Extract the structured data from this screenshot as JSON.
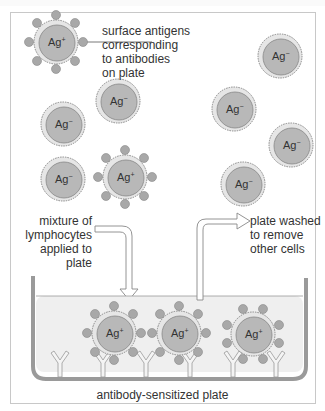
{
  "diagram": {
    "labels": {
      "surface_antigens": "surface antigens\ncorresponding\nto antibodies\non plate",
      "mixture": "mixture of\nlymphocytes\napplied to plate",
      "washed": "plate washed\nto remove\nother cells",
      "plate": "antibody-sensitized plate"
    },
    "cell_labels": {
      "positive": "Ag",
      "positive_sup": "+",
      "negative": "Ag",
      "negative_sup": "−"
    },
    "colors": {
      "cell_fill": "#b8b8b8",
      "cell_rim": "#e6e6e6",
      "antigen": "#a8a8a8",
      "plate_fill": "#efefef",
      "plate_wall": "#9a9a9a",
      "arrow_fill": "#ffffff",
      "arrow_stroke": "#888888"
    }
  }
}
